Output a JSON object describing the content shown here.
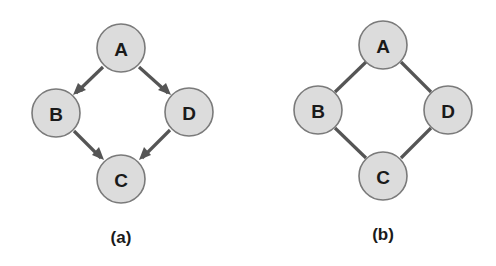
{
  "graphs": [
    {
      "caption": "(a)",
      "type": "directed",
      "nodes": [
        {
          "id": "A",
          "label": "A"
        },
        {
          "id": "B",
          "label": "B"
        },
        {
          "id": "D",
          "label": "D"
        },
        {
          "id": "C",
          "label": "C"
        }
      ],
      "edges": [
        {
          "from": "A",
          "to": "B"
        },
        {
          "from": "A",
          "to": "D"
        },
        {
          "from": "B",
          "to": "C"
        },
        {
          "from": "D",
          "to": "C"
        }
      ]
    },
    {
      "caption": "(b)",
      "type": "undirected",
      "nodes": [
        {
          "id": "A",
          "label": "A"
        },
        {
          "id": "B",
          "label": "B"
        },
        {
          "id": "D",
          "label": "D"
        },
        {
          "id": "C",
          "label": "C"
        }
      ],
      "edges": [
        {
          "from": "A",
          "to": "B"
        },
        {
          "from": "A",
          "to": "D"
        },
        {
          "from": "B",
          "to": "C"
        },
        {
          "from": "D",
          "to": "C"
        }
      ]
    }
  ],
  "colors": {
    "node_fill": "#dcdcdc",
    "node_stroke": "#7a7a7a",
    "edge": "#555555",
    "text": "#1a1a1a"
  }
}
